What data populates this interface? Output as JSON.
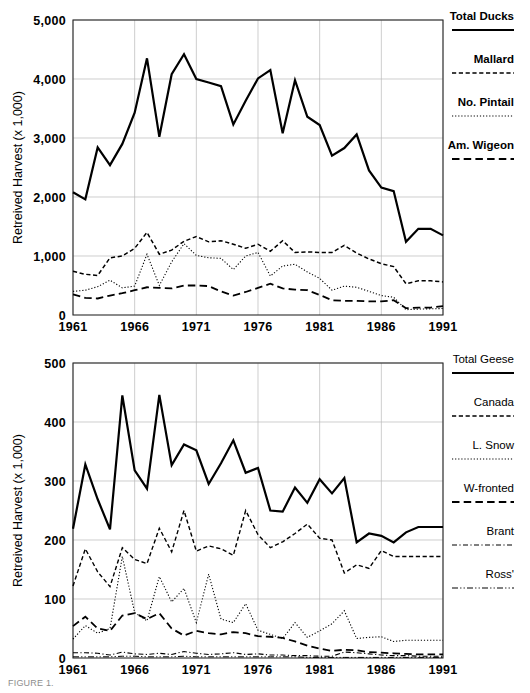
{
  "figure": {
    "caption": "FIGURE 1."
  },
  "chart_data": [
    {
      "id": "ducks",
      "type": "line",
      "title": "",
      "xlabel": "",
      "ylabel": "Retreived Harvest (x 1,000)",
      "xlim": [
        1961,
        1991
      ],
      "ylim": [
        0,
        5000
      ],
      "xticks": [
        1961,
        1966,
        1971,
        1976,
        1981,
        1986,
        1991
      ],
      "xticklabels": [
        "1961",
        "1966",
        "1971",
        "1976",
        "1981",
        "1986",
        "1991"
      ],
      "yticks": [
        0,
        1000,
        2000,
        3000,
        4000,
        5000
      ],
      "yticklabels": [
        "0",
        "1,000",
        "2,000",
        "3,000",
        "4,000",
        "5,000"
      ],
      "grid": true,
      "legend_position": "right",
      "x": [
        1961,
        1962,
        1963,
        1964,
        1965,
        1966,
        1967,
        1968,
        1969,
        1970,
        1971,
        1972,
        1973,
        1974,
        1975,
        1976,
        1977,
        1978,
        1979,
        1980,
        1981,
        1982,
        1983,
        1984,
        1985,
        1986,
        1987,
        1988,
        1989,
        1990,
        1991
      ],
      "series": [
        {
          "name": "Total Ducks",
          "dash": "solid",
          "width": 2.2,
          "values": [
            2080,
            1960,
            2840,
            2540,
            2900,
            3430,
            4350,
            3020,
            4080,
            4420,
            4000,
            3940,
            3880,
            3230,
            3630,
            4010,
            4150,
            3080,
            3980,
            3360,
            3220,
            2700,
            2830,
            3060,
            2450,
            2160,
            2100,
            1240,
            1460,
            1460,
            1350
          ]
        },
        {
          "name": "Mallard",
          "dash": "dash-med",
          "width": 1.5,
          "values": [
            740,
            690,
            670,
            970,
            1000,
            1130,
            1400,
            1030,
            1100,
            1250,
            1330,
            1240,
            1260,
            1200,
            1130,
            1200,
            1080,
            1260,
            1060,
            1070,
            1060,
            1060,
            1180,
            1050,
            950,
            870,
            820,
            530,
            580,
            580,
            560
          ]
        },
        {
          "name": "No. Pintail",
          "dash": "dot-fine",
          "width": 1.1,
          "values": [
            400,
            420,
            480,
            590,
            460,
            490,
            1030,
            500,
            900,
            1210,
            1010,
            970,
            960,
            770,
            1000,
            1060,
            660,
            830,
            860,
            730,
            620,
            420,
            490,
            470,
            400,
            330,
            300,
            90,
            100,
            105,
            110
          ]
        },
        {
          "name": "Am. Wigeon",
          "dash": "dash-long",
          "width": 1.8,
          "values": [
            350,
            290,
            280,
            330,
            370,
            420,
            470,
            460,
            450,
            500,
            500,
            490,
            400,
            330,
            390,
            460,
            530,
            450,
            430,
            420,
            340,
            250,
            240,
            240,
            230,
            230,
            250,
            115,
            125,
            125,
            150
          ]
        }
      ]
    },
    {
      "id": "geese",
      "type": "line",
      "title": "",
      "xlabel": "",
      "ylabel": "Retreived Harvest (x 1,000)",
      "xlim": [
        1961,
        1991
      ],
      "ylim": [
        0,
        500
      ],
      "xticks": [
        1961,
        1966,
        1971,
        1976,
        1981,
        1986,
        1991
      ],
      "xticklabels": [
        "1961",
        "1966",
        "1971",
        "1976",
        "1981",
        "1986",
        "1991"
      ],
      "yticks": [
        0,
        100,
        200,
        300,
        400,
        500
      ],
      "yticklabels": [
        "0",
        "100",
        "200",
        "300",
        "400",
        "500"
      ],
      "grid": true,
      "legend_position": "right",
      "x": [
        1961,
        1962,
        1963,
        1964,
        1965,
        1966,
        1967,
        1968,
        1969,
        1970,
        1971,
        1972,
        1973,
        1974,
        1975,
        1976,
        1977,
        1978,
        1979,
        1980,
        1981,
        1982,
        1983,
        1984,
        1985,
        1986,
        1987,
        1988,
        1989,
        1990,
        1991
      ],
      "series": [
        {
          "name": "Total Geese",
          "dash": "solid",
          "width": 2.2,
          "values": [
            219,
            328,
            269,
            218,
            445,
            318,
            287,
            446,
            327,
            362,
            352,
            295,
            330,
            369,
            314,
            322,
            250,
            248,
            289,
            263,
            303,
            279,
            305,
            196,
            211,
            207,
            196,
            213,
            222,
            222,
            222
          ]
        },
        {
          "name": "Canada",
          "dash": "dash-med",
          "width": 1.4,
          "values": [
            122,
            185,
            146,
            121,
            187,
            167,
            160,
            220,
            180,
            250,
            181,
            190,
            185,
            174,
            250,
            209,
            187,
            197,
            211,
            227,
            203,
            200,
            144,
            158,
            152,
            182,
            172,
            172,
            172,
            172,
            172
          ]
        },
        {
          "name": "L. Snow",
          "dash": "dot-fine",
          "width": 1.1,
          "values": [
            32,
            55,
            42,
            50,
            172,
            77,
            63,
            138,
            95,
            118,
            60,
            142,
            66,
            60,
            92,
            47,
            40,
            33,
            60,
            35,
            46,
            58,
            80,
            33,
            35,
            36,
            28,
            30,
            30,
            30,
            30
          ]
        },
        {
          "name": "W-fronted",
          "dash": "dash-long",
          "width": 1.8,
          "values": [
            54,
            70,
            50,
            46,
            72,
            76,
            66,
            76,
            50,
            38,
            46,
            42,
            40,
            44,
            42,
            37,
            36,
            34,
            28,
            21,
            16,
            12,
            14,
            13,
            10,
            9,
            8,
            7,
            6,
            6,
            6
          ]
        },
        {
          "name": "Brant",
          "dash": "dash-dot",
          "width": 1.1,
          "values": [
            9,
            9,
            8,
            5,
            10,
            7,
            6,
            8,
            6,
            11,
            8,
            6,
            7,
            9,
            6,
            7,
            5,
            5,
            4,
            4,
            3,
            3,
            10,
            9,
            7,
            5,
            4,
            4,
            3,
            3,
            3
          ]
        },
        {
          "name": "Ross'",
          "dash": "dash-dot-dot",
          "width": 1.0,
          "values": [
            2,
            2,
            2,
            2,
            3,
            3,
            2,
            2,
            2,
            3,
            2,
            2,
            2,
            2,
            2,
            2,
            2,
            2,
            2,
            1,
            1,
            1,
            1,
            1,
            1,
            1,
            1,
            1,
            1,
            1,
            1
          ]
        }
      ]
    }
  ]
}
